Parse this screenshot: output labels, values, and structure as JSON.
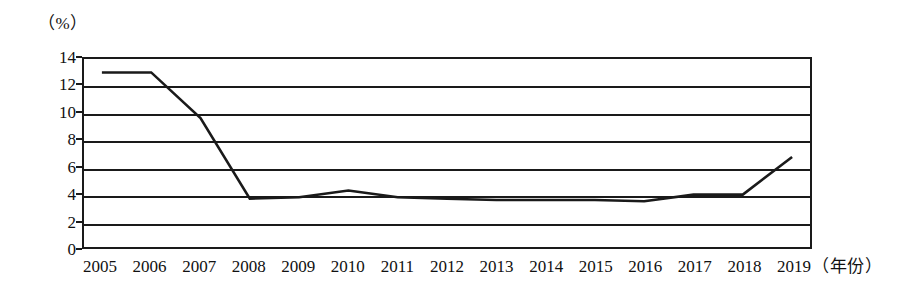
{
  "chart_data": {
    "type": "line",
    "title": "",
    "xlabel": "（年份）",
    "ylabel": "（%）",
    "categories": [
      "2005",
      "2006",
      "2007",
      "2008",
      "2009",
      "2010",
      "2011",
      "2012",
      "2013",
      "2014",
      "2015",
      "2016",
      "2017",
      "2018",
      "2019"
    ],
    "x": [
      2005,
      2006,
      2007,
      2008,
      2009,
      2010,
      2011,
      2012,
      2013,
      2014,
      2015,
      2016,
      2017,
      2018,
      2019
    ],
    "values": [
      13.0,
      13.0,
      9.6,
      3.6,
      3.7,
      4.2,
      3.7,
      3.6,
      3.5,
      3.5,
      3.5,
      3.4,
      3.9,
      3.9,
      6.7
    ],
    "series": [
      {
        "name": "",
        "values": [
          13.0,
          13.0,
          9.6,
          3.6,
          3.7,
          4.2,
          3.7,
          3.6,
          3.5,
          3.5,
          3.5,
          3.4,
          3.9,
          3.9,
          6.7
        ]
      }
    ],
    "ylim": [
      0,
      14
    ],
    "yticks": [
      0,
      2,
      4,
      6,
      8,
      10,
      12,
      14
    ],
    "ytick_labels": [
      "0",
      "2",
      "4",
      "6",
      "8",
      "10",
      "12",
      "14"
    ],
    "xlim": [
      2005,
      2019
    ],
    "grid": true,
    "grid_axis": "y",
    "legend": false,
    "legend_position": "none",
    "line_color": "#1a1a1a",
    "background_color": "#ffffff",
    "frame_color": "#1a1a1a"
  }
}
